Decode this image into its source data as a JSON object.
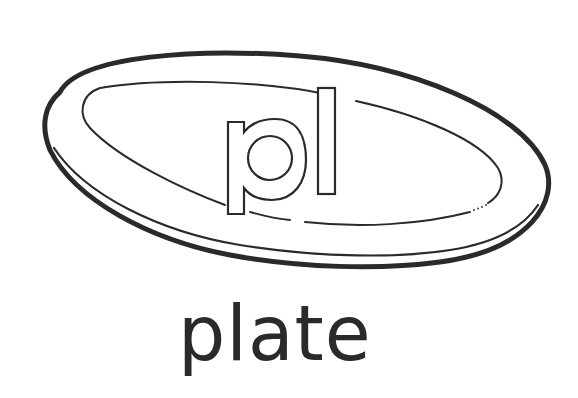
{
  "illustration": {
    "subject": "plate",
    "blend_label": "pl",
    "word": "plate",
    "colors": {
      "ink": "#2a2a2a",
      "background": "#ffffff"
    }
  }
}
